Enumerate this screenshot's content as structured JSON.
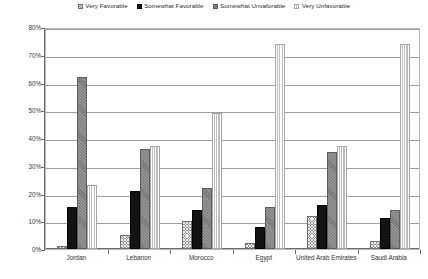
{
  "chart_data": {
    "type": "bar",
    "title": "",
    "subtitle": "",
    "xlabel": "",
    "ylabel": "",
    "ylim": [
      0,
      80
    ],
    "ytick_labels": [
      "0%",
      "10%",
      "20%",
      "30%",
      "40%",
      "50%",
      "60%",
      "70%",
      "80%"
    ],
    "ytick_values": [
      0,
      10,
      20,
      30,
      40,
      50,
      60,
      70,
      80
    ],
    "grid": true,
    "legend_position": "top-center",
    "categories": [
      "Jordan",
      "Lebanon",
      "Morocco",
      "Egypt",
      "United Arab Emirates",
      "Saudi Arabia"
    ],
    "series": [
      {
        "name": "Very Favorable",
        "values": [
          1,
          5,
          10,
          2,
          12,
          3
        ]
      },
      {
        "name": "Somewhat Favorable",
        "values": [
          15,
          21,
          14,
          8,
          16,
          11
        ]
      },
      {
        "name": "Somewhat Unvaforable",
        "values": [
          62,
          36,
          22,
          15,
          35,
          14
        ]
      },
      {
        "name": "Very Unfavorable",
        "values": [
          23,
          37,
          49,
          74,
          37,
          74
        ]
      }
    ],
    "series_colors": [
      "#8d8d8d",
      "#131313",
      "#808080",
      "#d6d6d6"
    ]
  },
  "legend": {
    "items": [
      {
        "label": "Very Favorable"
      },
      {
        "label": "Somewhat Favorable"
      },
      {
        "label": "Somewhat Unvaforable"
      },
      {
        "label": "Very Unfavorable"
      }
    ]
  }
}
